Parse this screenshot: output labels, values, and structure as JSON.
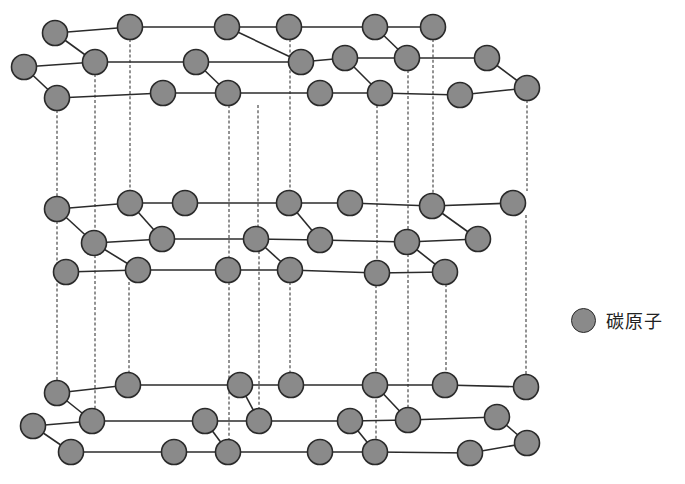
{
  "diagram": {
    "title": "",
    "colors": {
      "atom_fill": "#8a8a8a",
      "atom_stroke": "#2a2a2a",
      "bond": "#2b2b2b",
      "background": "#ffffff"
    },
    "atom_radius": 12.5,
    "legend": {
      "label": "碳原子",
      "icon": "carbon-atom-icon"
    },
    "layers": [
      {
        "name": "top-layer",
        "atoms": [
          [
            55,
            33
          ],
          [
            130,
            27
          ],
          [
            227,
            27
          ],
          [
            289,
            27
          ],
          [
            375,
            27
          ],
          [
            433,
            27
          ],
          [
            24,
            67
          ],
          [
            95,
            62
          ],
          [
            196,
            62
          ],
          [
            301,
            62
          ],
          [
            345,
            58
          ],
          [
            407,
            58
          ],
          [
            487,
            58
          ],
          [
            57,
            98
          ],
          [
            163,
            93
          ],
          [
            228,
            93
          ],
          [
            320,
            93
          ],
          [
            380,
            93
          ],
          [
            460,
            95
          ],
          [
            527,
            88
          ]
        ],
        "bonds": [
          [
            0,
            1
          ],
          [
            1,
            2
          ],
          [
            2,
            3
          ],
          [
            3,
            4
          ],
          [
            4,
            5
          ],
          [
            0,
            7
          ],
          [
            6,
            7
          ],
          [
            7,
            8
          ],
          [
            8,
            9
          ],
          [
            9,
            10
          ],
          [
            10,
            11
          ],
          [
            11,
            12
          ],
          [
            6,
            13
          ],
          [
            13,
            14
          ],
          [
            14,
            15
          ],
          [
            15,
            16
          ],
          [
            16,
            17
          ],
          [
            17,
            18
          ],
          [
            18,
            19
          ],
          [
            2,
            9
          ],
          [
            8,
            15
          ],
          [
            4,
            11
          ],
          [
            10,
            17
          ],
          [
            12,
            19
          ]
        ]
      },
      {
        "name": "middle-layer",
        "atoms": [
          [
            57,
            209
          ],
          [
            130,
            203
          ],
          [
            185,
            203
          ],
          [
            289,
            203
          ],
          [
            350,
            203
          ],
          [
            432,
            206
          ],
          [
            513,
            203
          ],
          [
            94,
            243
          ],
          [
            162,
            239
          ],
          [
            256,
            239
          ],
          [
            320,
            240
          ],
          [
            407,
            242
          ],
          [
            478,
            239
          ],
          [
            66,
            272
          ],
          [
            138,
            270
          ],
          [
            228,
            270
          ],
          [
            290,
            270
          ],
          [
            377,
            273
          ],
          [
            445,
            272
          ]
        ],
        "bonds": [
          [
            0,
            1
          ],
          [
            1,
            2
          ],
          [
            2,
            3
          ],
          [
            3,
            4
          ],
          [
            4,
            5
          ],
          [
            5,
            6
          ],
          [
            0,
            7
          ],
          [
            7,
            8
          ],
          [
            8,
            9
          ],
          [
            9,
            10
          ],
          [
            10,
            11
          ],
          [
            11,
            12
          ],
          [
            13,
            14
          ],
          [
            14,
            15
          ],
          [
            15,
            16
          ],
          [
            16,
            17
          ],
          [
            17,
            18
          ],
          [
            1,
            8
          ],
          [
            3,
            10
          ],
          [
            5,
            12
          ],
          [
            7,
            14
          ],
          [
            9,
            16
          ],
          [
            11,
            18
          ]
        ]
      },
      {
        "name": "bottom-layer",
        "atoms": [
          [
            57,
            393
          ],
          [
            128,
            385
          ],
          [
            240,
            385
          ],
          [
            291,
            385
          ],
          [
            375,
            385
          ],
          [
            445,
            385
          ],
          [
            526,
            387
          ],
          [
            33,
            426
          ],
          [
            92,
            421
          ],
          [
            205,
            421
          ],
          [
            259,
            421
          ],
          [
            350,
            421
          ],
          [
            408,
            420
          ],
          [
            497,
            417
          ],
          [
            71,
            452
          ],
          [
            174,
            452
          ],
          [
            228,
            452
          ],
          [
            320,
            452
          ],
          [
            375,
            452
          ],
          [
            470,
            453
          ],
          [
            527,
            443
          ]
        ],
        "bonds": [
          [
            0,
            1
          ],
          [
            1,
            2
          ],
          [
            2,
            3
          ],
          [
            3,
            4
          ],
          [
            4,
            5
          ],
          [
            5,
            6
          ],
          [
            0,
            8
          ],
          [
            7,
            8
          ],
          [
            8,
            9
          ],
          [
            9,
            10
          ],
          [
            10,
            11
          ],
          [
            11,
            12
          ],
          [
            12,
            13
          ],
          [
            7,
            14
          ],
          [
            14,
            15
          ],
          [
            15,
            16
          ],
          [
            16,
            17
          ],
          [
            17,
            18
          ],
          [
            18,
            19
          ],
          [
            19,
            20
          ],
          [
            2,
            10
          ],
          [
            9,
            16
          ],
          [
            4,
            12
          ],
          [
            11,
            18
          ],
          [
            13,
            20
          ]
        ]
      }
    ],
    "interlayer_dashed_lines": [
      [
        57,
        110,
        57,
        197
      ],
      [
        95,
        74,
        95,
        231
      ],
      [
        130,
        39,
        130,
        191
      ],
      [
        229,
        105,
        229,
        258
      ],
      [
        258,
        105,
        258,
        227
      ],
      [
        290,
        39,
        290,
        191
      ],
      [
        377,
        105,
        377,
        261
      ],
      [
        408,
        70,
        408,
        230
      ],
      [
        433,
        39,
        433,
        194
      ],
      [
        527,
        100,
        527,
        191
      ],
      [
        57,
        221,
        57,
        381
      ],
      [
        95,
        255,
        95,
        409
      ],
      [
        129,
        282,
        129,
        373
      ],
      [
        229,
        282,
        229,
        440
      ],
      [
        259,
        251,
        259,
        409
      ],
      [
        290,
        282,
        290,
        373
      ],
      [
        376,
        285,
        376,
        440
      ],
      [
        408,
        254,
        408,
        408
      ],
      [
        446,
        284,
        446,
        373
      ],
      [
        526,
        215,
        526,
        375
      ]
    ]
  }
}
